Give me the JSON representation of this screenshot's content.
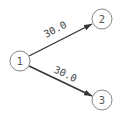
{
  "graph": {
    "nodes": [
      {
        "id": "1",
        "label": "1",
        "x": 20,
        "y": 61,
        "r": 10
      },
      {
        "id": "2",
        "label": "2",
        "x": 102,
        "y": 19,
        "r": 10
      },
      {
        "id": "3",
        "label": "3",
        "x": 102,
        "y": 100,
        "r": 10
      }
    ],
    "edges": [
      {
        "from": "1",
        "to": "2",
        "weight": "30.0",
        "directed": true
      },
      {
        "from": "1",
        "to": "3",
        "weight": "30.0",
        "directed": true
      }
    ]
  },
  "colors": {
    "node_stroke": "#888888",
    "edge": "#333333",
    "text": "#444444"
  }
}
